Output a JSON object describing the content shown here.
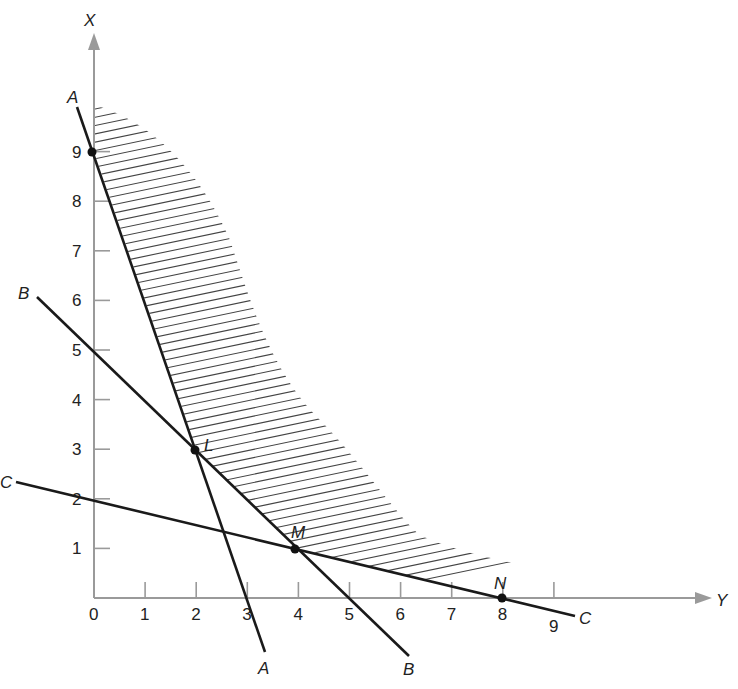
{
  "diagram": {
    "type": "linear-programming feasible region",
    "axes": {
      "vertical_label": "X",
      "horizontal_label": "Y",
      "vertical_ticks": [
        "1",
        "2",
        "3",
        "4",
        "5",
        "6",
        "7",
        "8",
        "9"
      ],
      "horizontal_ticks": [
        "0",
        "1",
        "2",
        "3",
        "4",
        "5",
        "6",
        "7",
        "8",
        "9"
      ],
      "origin_label": "0"
    },
    "lines": [
      {
        "name": "A",
        "label_start": "A",
        "label_end": "A",
        "equation": "X = 9 - 3Y"
      },
      {
        "name": "B",
        "label_start": "B",
        "label_end": "B",
        "equation": "X = 5 - Y"
      },
      {
        "name": "C",
        "label_start": "C",
        "label_end": "C",
        "equation": "X = 2 - Y/4"
      }
    ],
    "points": [
      {
        "name": "L",
        "label": "L",
        "y": 2,
        "x": 3
      },
      {
        "name": "M",
        "label": "M",
        "y": 4,
        "x": 1
      },
      {
        "name": "N",
        "label": "N",
        "y": 8,
        "x": 0
      },
      {
        "name": "A-intercept",
        "label": "",
        "y": 0,
        "x": 9
      }
    ],
    "shaded_region": "feasible region above A-L-M-N boundary (hatched)",
    "colors": {
      "axis": "#9a9a9a",
      "line": "#1a1a1a",
      "hatch": "#444444"
    }
  }
}
